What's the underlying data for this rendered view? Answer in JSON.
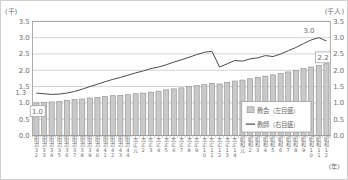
{
  "chart_data": {
    "type": "bar",
    "title": "",
    "left_axis": {
      "unit_label": "(千)",
      "min": 0.0,
      "max": 3.5,
      "step": 0.5
    },
    "right_axis": {
      "unit_label": "(千人)",
      "min": 0.0,
      "max": 3.5,
      "step": 0.5
    },
    "x_axis": {
      "unit_label": "(年)",
      "labels": [
        "明治32",
        "明治33",
        "明治34",
        "明治35",
        "明治36",
        "明治37",
        "明治38",
        "明治39",
        "明治40",
        "明治41",
        "明治42",
        "明治43",
        "明治44",
        "大正元",
        "大正2",
        "大正3",
        "大正4",
        "大正5",
        "大正6",
        "大正7",
        "大正8",
        "大正9",
        "大正10",
        "大正11",
        "大正12",
        "大正13",
        "大正14",
        "昭和元",
        "昭和2",
        "昭和3",
        "昭和4",
        "昭和5",
        "昭和6",
        "昭和7",
        "昭和8",
        "昭和9",
        "昭和10",
        "昭和11",
        "昭和12"
      ]
    },
    "series": [
      {
        "name": "教会（左目盛）",
        "type": "bar",
        "axis": "left",
        "values": [
          1.0,
          1.02,
          1.03,
          1.05,
          1.08,
          1.1,
          1.12,
          1.15,
          1.17,
          1.2,
          1.22,
          1.23,
          1.25,
          1.28,
          1.3,
          1.33,
          1.36,
          1.4,
          1.43,
          1.46,
          1.5,
          1.53,
          1.56,
          1.6,
          1.58,
          1.63,
          1.67,
          1.7,
          1.74,
          1.78,
          1.82,
          1.86,
          1.9,
          1.95,
          2.0,
          2.05,
          2.1,
          2.15,
          2.2
        ]
      },
      {
        "name": "教師（右目盛）",
        "type": "line",
        "axis": "right",
        "values": [
          1.3,
          1.28,
          1.26,
          1.27,
          1.3,
          1.35,
          1.42,
          1.5,
          1.57,
          1.65,
          1.72,
          1.78,
          1.85,
          1.92,
          1.98,
          2.05,
          2.1,
          2.17,
          2.25,
          2.32,
          2.4,
          2.48,
          2.55,
          2.58,
          2.1,
          2.2,
          2.3,
          2.28,
          2.35,
          2.38,
          2.45,
          2.42,
          2.5,
          2.6,
          2.7,
          2.82,
          2.93,
          3.0,
          2.9
        ]
      }
    ],
    "annotations": [
      {
        "text": "1.0",
        "target": "bar-first",
        "boxed": true
      },
      {
        "text": "2.2",
        "target": "bar-last",
        "boxed": true
      },
      {
        "text": "1.3",
        "target": "line-start",
        "boxed": false
      },
      {
        "text": "3.0",
        "target": "line-peak",
        "boxed": false
      }
    ],
    "legend": [
      {
        "swatch": "bar-swatch",
        "label": "教会（左目盛）"
      },
      {
        "swatch": "line-swatch",
        "label": "教師（右目盛）"
      }
    ],
    "grid": true,
    "colors": {
      "bar_fill": "#c9c9c9",
      "bar_border": "#8d8d8d",
      "line": "#4a4a4a",
      "grid": "#b4b4b4",
      "frame": "#979797",
      "text": "#6e6e6e",
      "annotation_box_border": "#9a9a9a",
      "background": "#ffffff"
    }
  }
}
